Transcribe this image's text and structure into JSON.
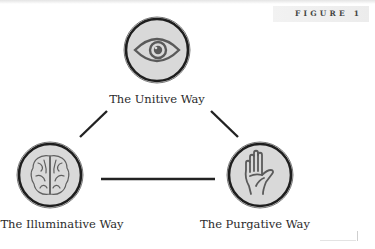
{
  "figure_label": "FIGURE 1",
  "nodes": [
    {
      "id": "unitive",
      "label": "The Unitive Way",
      "icon": "eye-icon"
    },
    {
      "id": "illuminative",
      "label": "The Illuminative Way",
      "icon": "brain-icon"
    },
    {
      "id": "purgative",
      "label": "The Purgative Way",
      "icon": "hand-icon"
    }
  ],
  "edges": [
    {
      "from": "unitive",
      "to": "illuminative"
    },
    {
      "from": "unitive",
      "to": "purgative"
    },
    {
      "from": "illuminative",
      "to": "purgative"
    }
  ],
  "colors": {
    "circle_fill": "#d9d9d9",
    "circle_stroke": "#1e1e1e",
    "icon_stroke": "#5a5a5a",
    "line": "#222222"
  }
}
